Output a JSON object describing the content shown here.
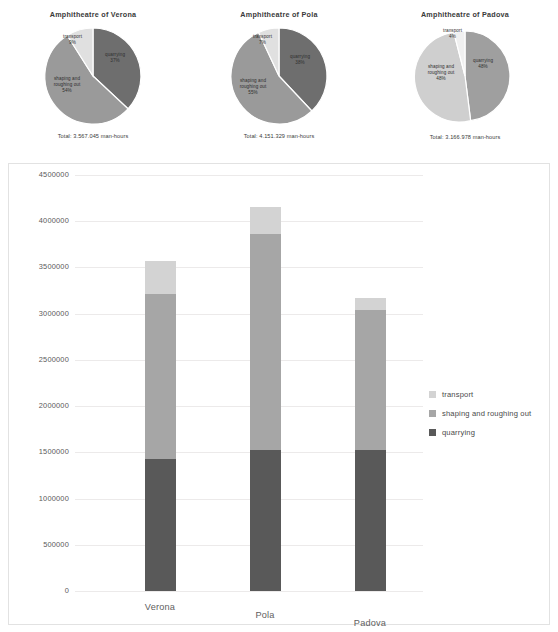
{
  "colors": {
    "transport": "#d3d3d3",
    "shaping": "#a6a6a6",
    "quarrying": "#595959",
    "grid": "#eceaea",
    "text": "#4a4a4a"
  },
  "categories": [
    "transport",
    "shaping and roughing out",
    "quarrying"
  ],
  "legend": {
    "items": [
      {
        "label": "transport"
      },
      {
        "label": "shaping and roughing out"
      },
      {
        "label": "quarrying"
      }
    ]
  },
  "pies": [
    {
      "title": "Amphitheatre of Verona",
      "total": "Total: 3.567.045 man-hours",
      "slices": [
        {
          "name": "transport",
          "pct": "9%",
          "value": 9
        },
        {
          "name": "quarrying",
          "pct": "37%",
          "value": 37
        },
        {
          "name": "shaping and roughing out",
          "pct": "54%",
          "value": 54
        }
      ]
    },
    {
      "title": "Amphitheatre of Pola",
      "total": "Total: 4.151.329 man-hours",
      "slices": [
        {
          "name": "transport",
          "pct": "7%",
          "value": 7
        },
        {
          "name": "quarrying",
          "pct": "38%",
          "value": 38
        },
        {
          "name": "shaping and roughing out",
          "pct": "55%",
          "value": 55
        }
      ]
    },
    {
      "title": "Amphitheatre of Padova",
      "total": "Total: 3.166.978 man-hours",
      "slices": [
        {
          "name": "transport",
          "pct": "4%",
          "value": 4
        },
        {
          "name": "quarrying",
          "pct": "48%",
          "value": 48
        },
        {
          "name": "shaping and roughing out",
          "pct": "48%",
          "value": 48
        }
      ]
    }
  ],
  "chart_data": {
    "type": "bar",
    "subtype": "stacked",
    "title": "",
    "xlabel": "",
    "ylabel": "",
    "categories": [
      "Verona",
      "Pola",
      "Padova"
    ],
    "series": [
      {
        "name": "quarrying",
        "values": [
          1430000,
          1530000,
          1520000
        ],
        "color": "#595959"
      },
      {
        "name": "shaping and roughing out",
        "values": [
          1780000,
          2330000,
          1520000
        ],
        "color": "#a6a6a6"
      },
      {
        "name": "transport",
        "values": [
          357000,
          291000,
          127000
        ],
        "color": "#d3d3d3"
      }
    ],
    "totals": [
      3567045,
      4151329,
      3166978
    ],
    "ylim": [
      0,
      4500000
    ],
    "yticks": [
      0,
      500000,
      1000000,
      1500000,
      2000000,
      2500000,
      3000000,
      3500000,
      4000000,
      4500000
    ],
    "ytick_labels": [
      "0",
      "500000",
      "1000000",
      "1500000",
      "2000000",
      "2500000",
      "3000000",
      "3500000",
      "4000000",
      "4500000"
    ],
    "grid": true,
    "legend_position": "right"
  }
}
